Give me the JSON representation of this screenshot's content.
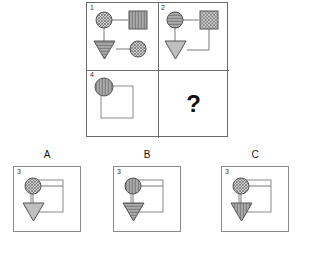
{
  "puzzle": {
    "type": "visual-analogy-matrix",
    "question_mark": "?",
    "colors": {
      "outline": "#6b6b6b",
      "option_outline": "#8a8a8a",
      "shape_stroke": "#555555",
      "fill_gray": "#bfbfbf",
      "connector": "#777777",
      "text": "#111111"
    },
    "matrix": {
      "rows": 2,
      "cols": 2,
      "cells": [
        {
          "number": "1",
          "position": "top-left",
          "shapes": [
            {
              "name": "circle",
              "pattern": "cross-hatch",
              "slot": "top-left"
            },
            {
              "name": "square",
              "pattern": "vertical-stripes",
              "slot": "top-right"
            },
            {
              "name": "triangle",
              "pattern": "horizontal-stripes",
              "slot": "bottom-left"
            },
            {
              "name": "circle",
              "pattern": "cross-hatch",
              "slot": "bottom-right"
            }
          ],
          "connectors": [
            "top-left to top-right",
            "top-left to bottom-left",
            "bottom-left to bottom-right"
          ]
        },
        {
          "number": "2",
          "position": "top-right",
          "shapes": [
            {
              "name": "circle",
              "pattern": "horizontal-stripes",
              "slot": "top-left"
            },
            {
              "name": "square",
              "pattern": "cross-hatch",
              "slot": "top-right"
            },
            {
              "name": "triangle",
              "pattern": "solid-gray",
              "slot": "bottom-left"
            }
          ],
          "connectors": [
            "top-left to top-right",
            "top-left to bottom-left",
            "top-right down and left to bottom-left"
          ]
        },
        {
          "number": "4",
          "position": "bottom-left",
          "shapes": [
            {
              "name": "circle",
              "pattern": "vertical-stripes",
              "slot": "top-left"
            },
            {
              "name": "square",
              "pattern": "outline-only",
              "slot": "right"
            }
          ],
          "connectors": [
            "circle overlaps square corner"
          ]
        },
        {
          "number": "3",
          "position": "bottom-right",
          "shapes": [],
          "connectors": [],
          "is_answer_slot": true
        }
      ]
    },
    "options": [
      {
        "label": "A",
        "number": "3",
        "shapes": [
          {
            "name": "circle",
            "pattern": "cross-hatch",
            "slot": "top-left"
          },
          {
            "name": "square",
            "pattern": "outline-only",
            "slot": "right"
          },
          {
            "name": "triangle",
            "pattern": "solid-gray",
            "slot": "bottom-left"
          }
        ]
      },
      {
        "label": "B",
        "number": "3",
        "shapes": [
          {
            "name": "circle",
            "pattern": "vertical-stripes",
            "slot": "top-left"
          },
          {
            "name": "square",
            "pattern": "outline-only",
            "slot": "right"
          },
          {
            "name": "triangle",
            "pattern": "horizontal-stripes",
            "slot": "bottom-left"
          }
        ]
      },
      {
        "label": "C",
        "number": "3",
        "shapes": [
          {
            "name": "circle",
            "pattern": "cross-hatch",
            "slot": "top-left"
          },
          {
            "name": "square",
            "pattern": "outline-only",
            "slot": "right"
          },
          {
            "name": "triangle",
            "pattern": "vertical-stripes",
            "slot": "bottom-left"
          }
        ]
      }
    ]
  }
}
